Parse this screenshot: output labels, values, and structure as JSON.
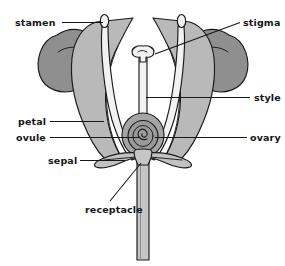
{
  "diagram": {
    "view": "longitudinal cross-section",
    "canvas": {
      "width": 285,
      "height": 266
    },
    "background_color": "#ffffff"
  },
  "palette": {
    "outline": "#1a1a1a",
    "text": "#161616",
    "petal_light": "#b9b9b9",
    "petal_mid": "#a8a8a8",
    "anther_dark": "#8f8f8f",
    "sepal_light": "#c2c2c2",
    "ovary_outer": "#a5a5a5",
    "ovary_inner": "#9a9a9a",
    "style_white": "#f2f2f2",
    "stem_light": "#c6c6c6",
    "stem_shade": "#b0b0b0"
  },
  "labels": [
    {
      "id": "stamen",
      "text": "stamen",
      "text_x": 15,
      "text_y": 26,
      "anchor": "start",
      "leader": "M 62,22.5 L 103,22.5",
      "side": "left",
      "points_to": "anther-left-tip"
    },
    {
      "id": "stigma",
      "text": "stigma",
      "text_x": 243,
      "text_y": 26,
      "anchor": "start",
      "leader": "M 240,22.5 L 155,54",
      "side": "right",
      "points_to": "stigma-head"
    },
    {
      "id": "style",
      "text": "style",
      "text_x": 254,
      "text_y": 101,
      "anchor": "start",
      "leader": "M 250,97.5 L 146,97.5",
      "side": "right",
      "points_to": "style-column"
    },
    {
      "id": "petal",
      "text": "petal",
      "text_x": 18,
      "text_y": 125,
      "anchor": "start",
      "leader": "M 50,121.5 L 104,121.5",
      "side": "left",
      "points_to": "petal-left"
    },
    {
      "id": "ovule",
      "text": "ovule",
      "text_x": 16,
      "text_y": 141,
      "anchor": "start",
      "leader": "M 50,137.5 L 139,137.5",
      "side": "left",
      "points_to": "ovule-spiral"
    },
    {
      "id": "ovary",
      "text": "ovary",
      "text_x": 250,
      "text_y": 141,
      "anchor": "start",
      "leader": "M 247,137.5 L 155,137.5",
      "side": "right",
      "points_to": "ovary-body"
    },
    {
      "id": "sepal",
      "text": "sepal",
      "text_x": 48,
      "text_y": 164,
      "anchor": "start",
      "leader": "M 80,160.5 L 125,160.5",
      "side": "left",
      "points_to": "sepal-left"
    },
    {
      "id": "receptacle",
      "text": "receptacle",
      "text_x": 85,
      "text_y": 213,
      "anchor": "start",
      "leader": "M 110,201 L 141,163",
      "side": "bottom",
      "points_to": "receptacle-node"
    }
  ],
  "structures": [
    {
      "id": "anther-left",
      "name": "left anther sac",
      "fill": "#8f8f8f"
    },
    {
      "id": "anther-right",
      "name": "right anther sac",
      "fill": "#8f8f8f"
    },
    {
      "id": "petal-left",
      "name": "left petal",
      "fill": "#b9b9b9"
    },
    {
      "id": "petal-right",
      "name": "right petal",
      "fill": "#b9b9b9"
    },
    {
      "id": "filament-left",
      "name": "left filament",
      "fill": "#f2f2f2"
    },
    {
      "id": "filament-right",
      "name": "right filament",
      "fill": "#f2f2f2"
    },
    {
      "id": "style-column",
      "name": "style",
      "fill": "#f2f2f2"
    },
    {
      "id": "stigma-head",
      "name": "stigma",
      "fill": "#f2f2f2"
    },
    {
      "id": "ovary-body",
      "name": "ovary",
      "fill": "#a5a5a5"
    },
    {
      "id": "ovule-spiral",
      "name": "ovule",
      "fill": "#9a9a9a"
    },
    {
      "id": "sepal-left",
      "name": "left sepal",
      "fill": "#c2c2c2"
    },
    {
      "id": "sepal-right",
      "name": "right sepal",
      "fill": "#c2c2c2"
    },
    {
      "id": "stem",
      "name": "stem / pedicel",
      "fill": "#c6c6c6"
    }
  ]
}
